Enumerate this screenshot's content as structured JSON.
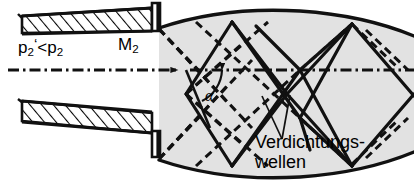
{
  "diagram": {
    "labels": {
      "pressure_p": "p",
      "pressure_sub": "2",
      "pressure_prime": "‘",
      "pressure_rel": "<p",
      "pressure_sub2": "2",
      "pressure_full": "p2'<p2",
      "mach_m": "M",
      "mach_sub": "2",
      "mach_full": "M2",
      "angle": "α",
      "waves_line1": "Verdichtungs-",
      "waves_line2": "wellen",
      "waves_full": "Verdichtungswellen"
    },
    "colors": {
      "ink": "#111111",
      "plume_fill": "#e2e2e2",
      "background": "#ffffff",
      "hatch": "#000000"
    },
    "elements": {
      "nozzle_wall_upper": "hatched-converging-wall",
      "nozzle_wall_lower": "hatched-converging-wall",
      "centerline": "dash-dot axis with arrowhead at nozzle exit",
      "expansion_waves": "dashed lines",
      "compression_waves": "solid lines",
      "jet_boundary": "solid curved barrel shape",
      "leader_lines": "two thin lines from Verdichtungswellen label to shock"
    }
  }
}
